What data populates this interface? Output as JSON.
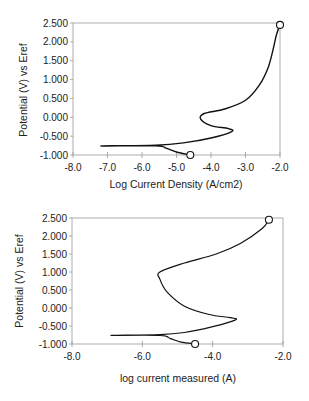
{
  "chart_data": [
    {
      "type": "line",
      "title": "",
      "xlabel": "Log Current Density (A/cm2)",
      "ylabel": "Potential (V) vs Eref",
      "xlim": [
        -8.0,
        -2.0
      ],
      "ylim": [
        -1.0,
        2.5
      ],
      "x_ticks": [
        "-8.0",
        "-7.0",
        "-6.0",
        "-5.0",
        "-4.0",
        "-3.0",
        "-2.0"
      ],
      "y_ticks": [
        "2.500",
        "2.000",
        "1.500",
        "1.000",
        "0.500",
        "0.000",
        "-0.500",
        "-1.000"
      ],
      "grid": false,
      "legend": null,
      "series": [
        {
          "name": "polarization curve",
          "x": [
            -4.6,
            -5.0,
            -5.3,
            -5.6,
            -7.2,
            -5.6,
            -4.8,
            -4.0,
            -3.4,
            -3.5,
            -4.0,
            -4.3,
            -4.2,
            -3.6,
            -3.0,
            -2.6,
            -2.35,
            -2.2,
            -2.1,
            -2.0
          ],
          "y": [
            -1.0,
            -0.92,
            -0.82,
            -0.76,
            -0.76,
            -0.74,
            -0.68,
            -0.55,
            -0.38,
            -0.3,
            -0.22,
            -0.05,
            0.1,
            0.22,
            0.45,
            0.85,
            1.3,
            1.8,
            2.2,
            2.45
          ]
        }
      ],
      "markers": [
        {
          "x": -4.6,
          "y": -1.0,
          "shape": "open-circle"
        },
        {
          "x": -2.0,
          "y": 2.45,
          "shape": "open-circle"
        }
      ]
    },
    {
      "type": "line",
      "title": "",
      "xlabel": "log current measured (A)",
      "ylabel": "Potential (V) vs Eref",
      "xlim": [
        -8.0,
        -2.0
      ],
      "ylim": [
        -1.0,
        2.5
      ],
      "x_ticks": [
        "-8.0",
        "-6.0",
        "-4.0",
        "-2.0"
      ],
      "y_ticks": [
        "2.500",
        "2.000",
        "1.500",
        "1.000",
        "0.500",
        "0.000",
        "-0.500",
        "-1.000"
      ],
      "grid": false,
      "legend": null,
      "series": [
        {
          "name": "polarization curve",
          "x": [
            -4.5,
            -4.9,
            -5.2,
            -5.5,
            -6.9,
            -5.5,
            -4.8,
            -4.0,
            -3.35,
            -3.5,
            -4.1,
            -4.8,
            -5.3,
            -5.5,
            -5.5,
            -4.8,
            -3.9,
            -3.2,
            -2.6,
            -2.4
          ],
          "y": [
            -1.0,
            -0.95,
            -0.85,
            -0.76,
            -0.76,
            -0.74,
            -0.68,
            -0.52,
            -0.33,
            -0.27,
            -0.18,
            0.05,
            0.45,
            0.8,
            1.0,
            1.25,
            1.5,
            1.8,
            2.2,
            2.45
          ]
        }
      ],
      "markers": [
        {
          "x": -4.5,
          "y": -1.0,
          "shape": "open-circle"
        },
        {
          "x": -2.4,
          "y": 2.45,
          "shape": "open-circle"
        }
      ]
    }
  ],
  "charts": {
    "top": {
      "xlabel": "Log Current Density (A/cm2)",
      "ylabel": "Potential (V) vs Eref",
      "x_ticks": [
        "-8.0",
        "-7.0",
        "-6.0",
        "-5.0",
        "-4.0",
        "-3.0",
        "-2.0"
      ],
      "y_ticks": [
        "2.500",
        "2.000",
        "1.500",
        "1.000",
        "0.500",
        "0.000",
        "-0.500",
        "-1.000"
      ]
    },
    "bottom": {
      "xlabel": "log current measured (A)",
      "ylabel": "Potential (V) vs Eref",
      "x_ticks": [
        "-8.0",
        "-6.0",
        "-4.0",
        "-2.0"
      ],
      "y_ticks": [
        "2.500",
        "2.000",
        "1.500",
        "1.000",
        "0.500",
        "0.000",
        "-0.500",
        "-1.000"
      ]
    }
  }
}
